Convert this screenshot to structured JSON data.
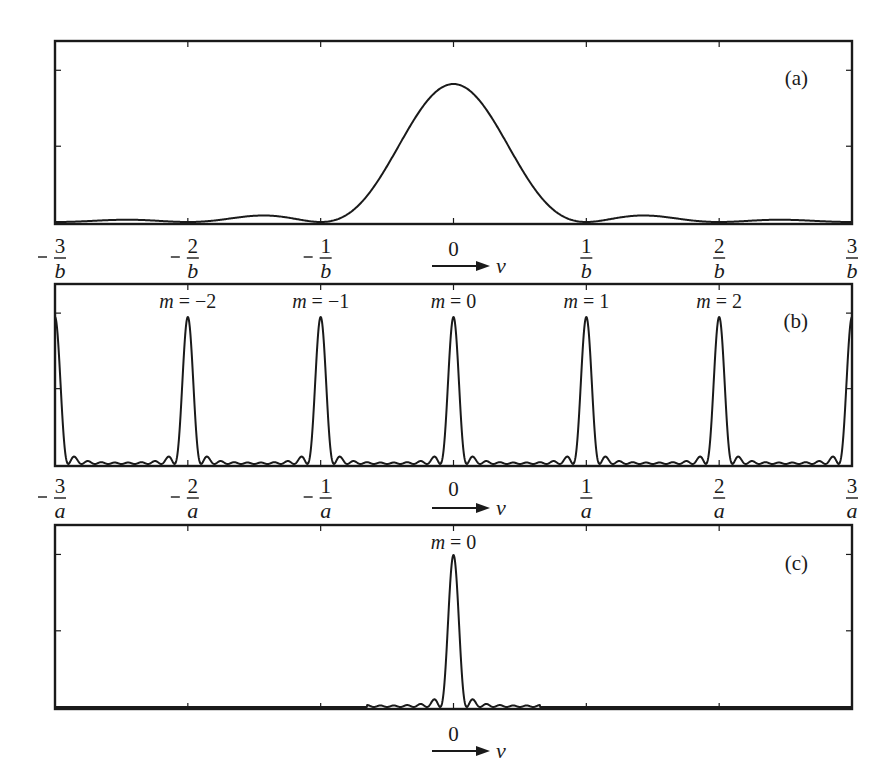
{
  "figure": {
    "arrow_label": "v",
    "panels": [
      {
        "id": "a",
        "label": "(a)",
        "tick_labels": [
          {
            "sign": "-",
            "num": "3",
            "den": "b"
          },
          {
            "sign": "-",
            "num": "2",
            "den": "b"
          },
          {
            "sign": "-",
            "num": "1",
            "den": "b"
          },
          {
            "sign": "",
            "num": "0",
            "den": ""
          },
          {
            "sign": "",
            "num": "1",
            "den": "b"
          },
          {
            "sign": "",
            "num": "2",
            "den": "b"
          },
          {
            "sign": "",
            "num": "3",
            "den": "b"
          }
        ]
      },
      {
        "id": "b",
        "label": "(b)",
        "order_labels": [
          "m = −2",
          "m = −1",
          "m = 0",
          "m = 1",
          "m = 2"
        ],
        "tick_labels": [
          {
            "sign": "-",
            "num": "3",
            "den": "a"
          },
          {
            "sign": "-",
            "num": "2",
            "den": "a"
          },
          {
            "sign": "-",
            "num": "1",
            "den": "a"
          },
          {
            "sign": "",
            "num": "0",
            "den": ""
          },
          {
            "sign": "",
            "num": "1",
            "den": "a"
          },
          {
            "sign": "",
            "num": "2",
            "den": "a"
          },
          {
            "sign": "",
            "num": "3",
            "den": "a"
          }
        ]
      },
      {
        "id": "c",
        "label": "(c)",
        "order_labels": [
          "m = 0"
        ],
        "tick_labels": [
          {
            "sign": "",
            "num": "0",
            "den": ""
          }
        ]
      }
    ]
  },
  "chart_data": [
    {
      "type": "line",
      "title": "(a) Single-slit diffraction envelope",
      "xlabel": "v",
      "ylabel": "",
      "x_ticks": [
        "-3/b",
        "-2/b",
        "-1/b",
        "0",
        "1/b",
        "2/b",
        "3/b"
      ],
      "xlim": [
        -3,
        3
      ],
      "ylim": [
        0,
        1.2
      ],
      "grid": false,
      "function": "sinc^2(b v)",
      "series": [
        {
          "name": "intensity",
          "x": [
            -3,
            -2.5,
            -2,
            -1.43,
            -1,
            -0.5,
            0,
            0.5,
            1,
            1.43,
            2,
            2.5,
            3
          ],
          "y": [
            0,
            0.016,
            0,
            0.047,
            0,
            0.405,
            1.0,
            0.405,
            0,
            0.047,
            0,
            0.016,
            0
          ]
        }
      ]
    },
    {
      "type": "line",
      "title": "(b) Grating principal maxima",
      "xlabel": "v",
      "x_ticks": [
        "-3/a",
        "-2/a",
        "-1/a",
        "0",
        "1/a",
        "2/a",
        "3/a"
      ],
      "xlim": [
        -3,
        3
      ],
      "ylim": [
        0,
        1.2
      ],
      "grid": false,
      "annotations": [
        "m=-2",
        "m=-1",
        "m=0",
        "m=1",
        "m=2"
      ],
      "series": [
        {
          "name": "intensity",
          "peaks_x": [
            -3,
            -2,
            -1,
            0,
            1,
            2,
            3
          ],
          "peaks_y": [
            1,
            1,
            1,
            1,
            1,
            1,
            1
          ],
          "N_slits": 10,
          "secondary_maxima": "small ripples between principal maxima"
        }
      ]
    },
    {
      "type": "line",
      "title": "(c) Only zero-order maximum",
      "xlabel": "v",
      "x_ticks": [
        "0"
      ],
      "xlim": [
        -3,
        3
      ],
      "ylim": [
        0,
        1.2
      ],
      "grid": false,
      "annotations": [
        "m=0"
      ],
      "series": [
        {
          "name": "intensity",
          "peaks_x": [
            0
          ],
          "peaks_y": [
            1
          ],
          "secondary_maxima": "small ripples near center"
        }
      ]
    }
  ]
}
